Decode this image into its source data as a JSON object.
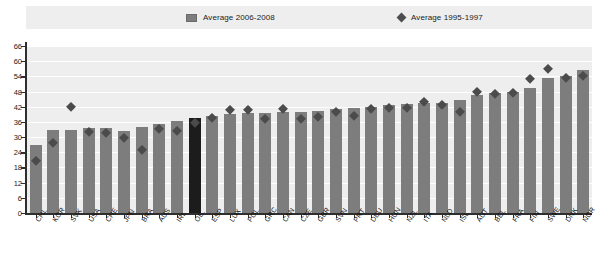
{
  "legend": {
    "bar_series_label": "Average 2006-2008",
    "diamond_series_label": "Average 1995-1997",
    "bar_color": "#7d7d7d",
    "diamond_color": "#4b4b4b",
    "highlight_color": "#1c1c1c"
  },
  "chart_data": {
    "type": "bar",
    "title": "",
    "xlabel": "",
    "ylabel": "",
    "ylim": [
      0,
      66
    ],
    "yticks": [
      0,
      6,
      12,
      18,
      24,
      30,
      36,
      42,
      48,
      54,
      60,
      66
    ],
    "grid": true,
    "legend_position": "top",
    "highlight_category": "OE.",
    "categories": [
      "CHL",
      "KOR",
      "SVK",
      "USA",
      "CHE",
      "JPN",
      "BRA",
      "AUS",
      "IRL",
      "OE.",
      "ESP",
      "LUX",
      "POL",
      "GRC",
      "CAN",
      "CZE",
      "GBR",
      "SVN",
      "PRT",
      "DEU",
      "HUN",
      "NZL",
      "ITA",
      "NLD",
      "ISL",
      "AUT",
      "BEL",
      "FRA",
      "FIN",
      "SWE",
      "DNK",
      "NOR"
    ],
    "series": [
      {
        "name": "Average 2006-2008",
        "marker": "bar",
        "values": [
          27.0,
          33.0,
          33.0,
          33.5,
          33.5,
          32.5,
          34.0,
          35.0,
          36.5,
          37.5,
          38.5,
          39.0,
          39.5,
          39.5,
          40.0,
          40.0,
          40.5,
          41.0,
          41.5,
          42.0,
          42.5,
          43.0,
          43.5,
          43.5,
          44.5,
          46.5,
          47.5,
          48.0,
          49.5,
          53.5,
          54.0,
          56.5
        ]
      },
      {
        "name": "Average 1995-1997",
        "marker": "diamond",
        "values": [
          22.0,
          29.0,
          43.5,
          33.5,
          33.0,
          31.0,
          26.5,
          34.5,
          34.0,
          37.0,
          39.0,
          42.0,
          42.0,
          38.5,
          42.5,
          38.5,
          39.5,
          41.5,
          40.0,
          42.5,
          43.0,
          43.0,
          45.5,
          44.0,
          41.5,
          49.5,
          48.5,
          49.0,
          54.5,
          58.5,
          55.0,
          55.5
        ]
      }
    ]
  }
}
